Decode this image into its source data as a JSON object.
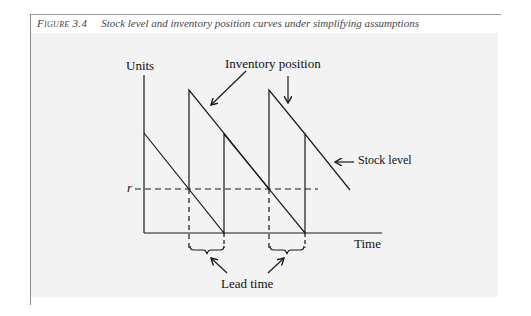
{
  "caption": {
    "figure_label": "Figure 3.4",
    "title": "Stock level and inventory position curves under simplifying assumptions"
  },
  "diagram": {
    "y_axis_label": "Units",
    "x_axis_label": "Time",
    "reorder_point_label": "r",
    "annotations": {
      "inventory_position": "Inventory position",
      "stock_level": "Stock level",
      "lead_time": "Lead time"
    },
    "colors": {
      "line": "#1a1a1a",
      "background": "#f3f3f3"
    }
  }
}
